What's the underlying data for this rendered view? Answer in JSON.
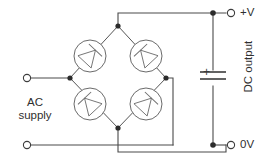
{
  "diagram": {
    "type": "schematic",
    "width": 270,
    "height": 167,
    "background_color": "#ffffff",
    "wire_color": "#4a4a4a",
    "component_color": "#6a6a6a"
  },
  "labels": {
    "ac_supply": "AC\nsupply",
    "positive_rail": "+V",
    "zero_rail": "0V",
    "dc_output": "DC output",
    "capacitor_polarity": "+"
  },
  "components": {
    "bridge": {
      "name": "diode bridge rectifier",
      "diode_count": 4,
      "diodes": [
        {
          "position": "top-left",
          "points_toward": "top node"
        },
        {
          "position": "top-right",
          "points_toward": "top node"
        },
        {
          "position": "bottom-left",
          "points_toward": "left node"
        },
        {
          "position": "bottom-right",
          "points_toward": "right node"
        }
      ],
      "nodes": {
        "top": "+V output",
        "bottom": "0V output",
        "left": "AC input 1",
        "right": "AC input 2"
      }
    },
    "capacitor": {
      "name": "smoothing capacitor",
      "polarized": true,
      "plus_terminal": "top"
    },
    "terminals": [
      {
        "name": "ac-terminal-top",
        "label": ""
      },
      {
        "name": "ac-terminal-bottom",
        "label": ""
      },
      {
        "name": "dc-terminal-positive",
        "label": "+V"
      },
      {
        "name": "dc-terminal-zero",
        "label": "0V"
      }
    ]
  }
}
